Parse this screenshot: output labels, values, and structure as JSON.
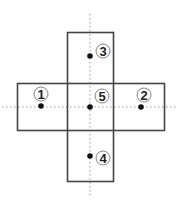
{
  "diagram": {
    "stroke_color": "#444444",
    "dot_color": "#111111",
    "guide_color": "#999999",
    "points": [
      {
        "id": "1",
        "label": "1"
      },
      {
        "id": "2",
        "label": "2"
      },
      {
        "id": "3",
        "label": "3"
      },
      {
        "id": "4",
        "label": "4"
      },
      {
        "id": "5",
        "label": "5"
      }
    ]
  }
}
